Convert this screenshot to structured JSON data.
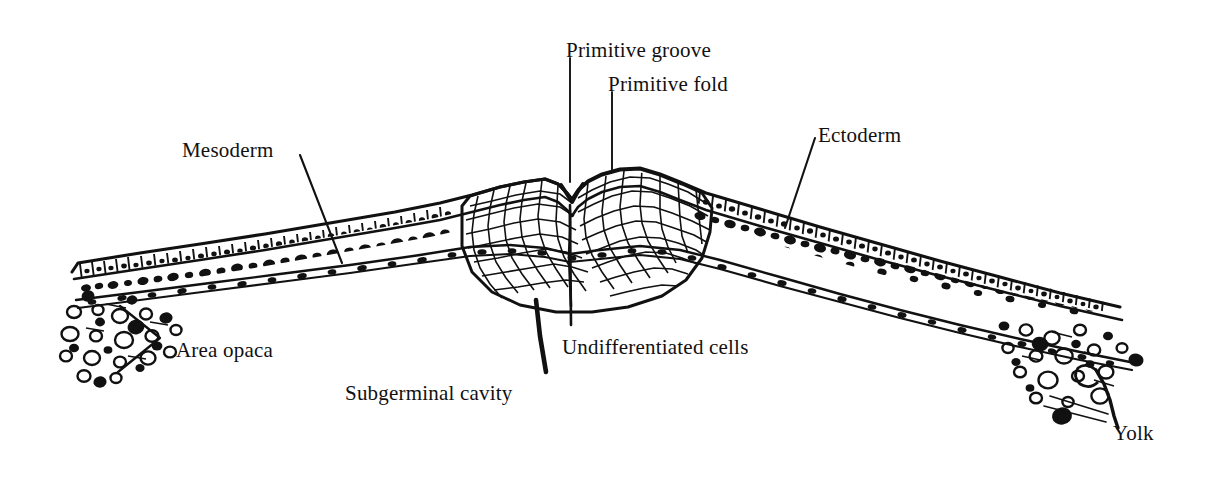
{
  "figure": {
    "kind": "line-drawing",
    "ink_color": "#111111",
    "background_color": "#ffffff"
  },
  "labels": [
    {
      "id": "primitive-groove",
      "text": "Primitive groove",
      "x": 566,
      "y": 40
    },
    {
      "id": "primitive-fold",
      "text": "Primitive fold",
      "x": 608,
      "y": 74
    },
    {
      "id": "ectoderm",
      "text": "Ectoderm",
      "x": 818,
      "y": 125
    },
    {
      "id": "mesoderm",
      "text": "Mesoderm",
      "x": 182,
      "y": 140
    },
    {
      "id": "undifferentiated-cells",
      "text": "Undifferentiated cells",
      "x": 562,
      "y": 337
    },
    {
      "id": "area-opaca",
      "text": "Area opaca",
      "x": 176,
      "y": 340
    },
    {
      "id": "subgerminal-cavity",
      "text": "Subgerminal cavity",
      "x": 345,
      "y": 383
    },
    {
      "id": "yolk",
      "text": "Yolk",
      "x": 1113,
      "y": 423
    }
  ],
  "leaders": [
    {
      "id": "leader-primitive-groove",
      "kind": "vertical-long"
    },
    {
      "id": "leader-primitive-fold",
      "kind": "vertical-short"
    },
    {
      "id": "leader-ectoderm",
      "kind": "diagonal"
    },
    {
      "id": "leader-mesoderm",
      "kind": "diagonal"
    },
    {
      "id": "leader-subgerminal-cavity",
      "kind": "thick-stroke"
    },
    {
      "id": "leader-area-opaca",
      "kind": "bracket"
    },
    {
      "id": "leader-yolk",
      "kind": "double-hairline"
    }
  ],
  "structures": [
    {
      "id": "ectoderm-epithelium",
      "name": "Ectoderm (columnar epithelium)"
    },
    {
      "id": "mesoderm-layer",
      "name": "Mesoderm (loose mesenchyme)"
    },
    {
      "id": "endoderm-layer",
      "name": "Endoderm (thin beaded sheet)"
    },
    {
      "id": "primitive-streak-mass",
      "name": "Undifferentiated cell mass of primitive streak"
    },
    {
      "id": "yolk-granules-left",
      "name": "Yolk granules, left area opaca"
    },
    {
      "id": "yolk-granules-right",
      "name": "Yolk granules, right area opaca"
    }
  ]
}
